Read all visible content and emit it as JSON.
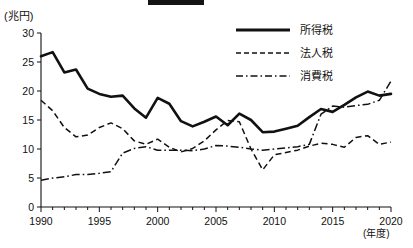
{
  "chart_data": {
    "type": "line",
    "title": "",
    "xlabel": "年度",
    "ylabel": "兆円",
    "y_unit_label": "(兆円)",
    "x_unit_label": "(年度)",
    "xlim": [
      1990,
      2020
    ],
    "ylim": [
      0,
      30
    ],
    "yticks": [
      0,
      5,
      10,
      15,
      20,
      25,
      30
    ],
    "xticks": [
      1990,
      1995,
      2000,
      2005,
      2010,
      2015,
      2020
    ],
    "xtick_labels": [
      "1990",
      "1995",
      "2000",
      "2005",
      "2010",
      "2015",
      "2020"
    ],
    "ytick_labels": [
      "0",
      "5",
      "10",
      "15",
      "20",
      "25",
      "30"
    ],
    "grid": false,
    "legend_position": "top-right",
    "x": [
      1990,
      1991,
      1992,
      1993,
      1994,
      1995,
      1996,
      1997,
      1998,
      1999,
      2000,
      2001,
      2002,
      2003,
      2004,
      2005,
      2006,
      2007,
      2008,
      2009,
      2010,
      2011,
      2012,
      2013,
      2014,
      2015,
      2016,
      2017,
      2018,
      2019,
      2020
    ],
    "series": [
      {
        "name": "所得税",
        "style": "solid",
        "values": [
          26.0,
          26.7,
          23.2,
          23.7,
          20.4,
          19.5,
          19.0,
          19.2,
          17.0,
          15.4,
          18.8,
          17.8,
          14.8,
          13.9,
          14.7,
          15.6,
          14.1,
          16.1,
          15.0,
          12.9,
          13.0,
          13.5,
          14.0,
          15.5,
          16.9,
          16.4,
          17.6,
          18.9,
          19.9,
          19.2,
          19.5
        ]
      },
      {
        "name": "法人税",
        "style": "dashed",
        "values": [
          18.4,
          16.6,
          13.7,
          12.1,
          12.4,
          13.7,
          14.5,
          13.5,
          11.4,
          10.8,
          11.7,
          10.3,
          9.5,
          10.1,
          11.4,
          13.3,
          14.9,
          14.7,
          10.0,
          6.4,
          9.0,
          9.4,
          9.8,
          10.5,
          11.0,
          10.8,
          10.3,
          12.0,
          12.3,
          10.8,
          11.2
        ]
      },
      {
        "name": "消費税",
        "style": "dash-dot",
        "values": [
          4.6,
          5.0,
          5.2,
          5.6,
          5.6,
          5.8,
          6.1,
          9.3,
          10.1,
          10.4,
          9.8,
          9.8,
          9.8,
          9.7,
          10.0,
          10.6,
          10.5,
          10.3,
          10.0,
          9.8,
          10.0,
          10.2,
          10.4,
          10.8,
          16.0,
          17.4,
          17.2,
          17.5,
          17.7,
          18.4,
          21.7
        ]
      }
    ]
  },
  "legend": {
    "items": [
      {
        "label": "所得税"
      },
      {
        "label": "法人税"
      },
      {
        "label": "消費税"
      }
    ]
  }
}
